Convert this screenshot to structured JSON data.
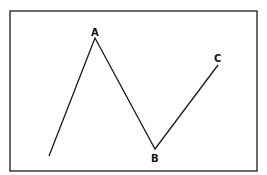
{
  "diagram": {
    "type": "zigzag-line",
    "frame": {
      "x": 10,
      "y": 11,
      "width": 247,
      "height": 160,
      "stroke": "#1a1a1a"
    },
    "line_color": "#1a1a1a",
    "points": [
      {
        "id": "start",
        "x": 49,
        "y": 156,
        "label": ""
      },
      {
        "id": "A",
        "x": 95,
        "y": 38,
        "label": "A"
      },
      {
        "id": "B",
        "x": 155,
        "y": 149,
        "label": "B"
      },
      {
        "id": "C",
        "x": 218,
        "y": 65,
        "label": "C"
      }
    ],
    "labels": {
      "A": {
        "text": "A",
        "x": 91,
        "y": 36
      },
      "B": {
        "text": "B",
        "x": 151,
        "y": 161
      },
      "C": {
        "text": "C",
        "x": 214,
        "y": 62
      }
    }
  }
}
